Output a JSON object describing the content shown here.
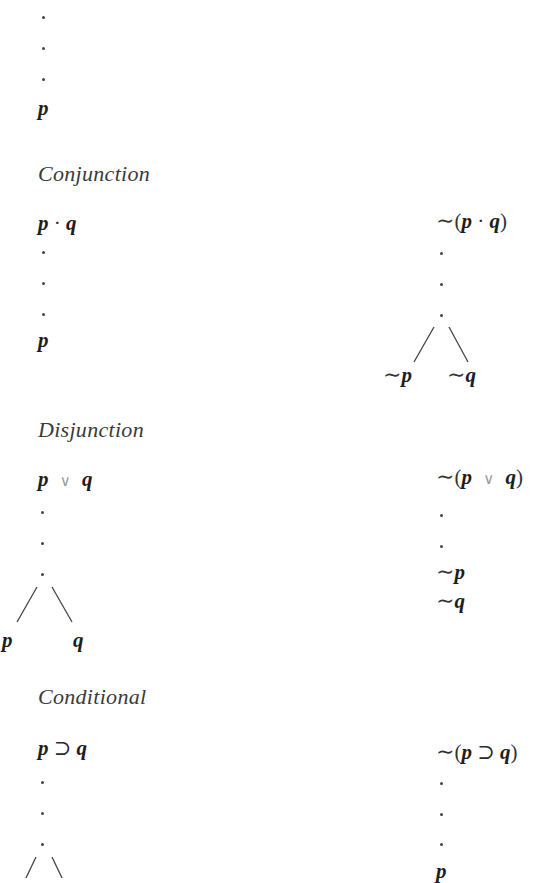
{
  "sections": {
    "top": {
      "result": "p"
    },
    "conjunction": {
      "title": "Conjunction",
      "left": {
        "p": "p",
        "op": "·",
        "q": "q",
        "result": "p"
      },
      "right": {
        "tilde": "∼",
        "open": "(",
        "p": "p",
        "op": "·",
        "q": "q",
        "close": ")",
        "branch_left": "p",
        "branch_right": "q"
      }
    },
    "disjunction": {
      "title": "Disjunction",
      "left": {
        "p": "p",
        "op": "∨",
        "q": "q",
        "branch_left": "p",
        "branch_right": "q"
      },
      "right": {
        "tilde": "∼",
        "open": "(",
        "p": "p",
        "op": "∨",
        "q": "q",
        "close": ")",
        "result1": "p",
        "result2": "q"
      }
    },
    "conditional": {
      "title": "Conditional",
      "left": {
        "p": "p",
        "op": "⊃",
        "q": "q"
      },
      "right": {
        "tilde": "∼",
        "open": "(",
        "p": "p",
        "op": "⊃",
        "q": "q",
        "close": ")",
        "result": "p"
      }
    }
  },
  "symbols": {
    "negation": "∼"
  },
  "colors": {
    "text": "#1e1e1e",
    "heading": "#3a3a3a",
    "light_operator": "#9a9a9a",
    "background": "#ffffff"
  }
}
